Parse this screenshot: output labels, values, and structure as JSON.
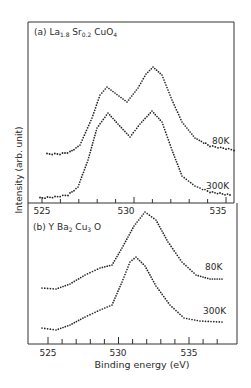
{
  "figure": {
    "y_axis_label": "Intensity (arb. unit)",
    "x_axis_label": "Binding energy (eV)"
  },
  "panel_a": {
    "label_prefix": "(a) La",
    "sub1": "1.8",
    "mid": " Sr",
    "sub2": "0.2",
    "mid2": " CuO",
    "sub3": "4",
    "ticks": [
      "525",
      "530",
      "535"
    ],
    "curve_labels": [
      "80K",
      "300K"
    ]
  },
  "panel_b": {
    "label_prefix": "(b) Y Ba",
    "sub1": "2",
    "mid": " Cu",
    "sub2": "3",
    "mid2": " O",
    "sub3": "7",
    "ticks": [
      "525",
      "530",
      "535"
    ],
    "curve_labels": [
      "80K",
      "300K"
    ]
  },
  "chart_data": [
    {
      "type": "scatter",
      "title": "(a) La1.8Sr0.2CuO4",
      "xlabel": "Binding energy (eV)",
      "ylabel": "Intensity (arb. unit)",
      "xlim": [
        524.5,
        536.5
      ],
      "x_ticks": [
        525,
        530,
        535
      ],
      "grid": false,
      "series": [
        {
          "name": "80K",
          "x": [
            525,
            526,
            527,
            528,
            529.2,
            530.2,
            531.5,
            532.5,
            533.5,
            535,
            536.5
          ],
          "y": [
            0.35,
            0.36,
            0.45,
            0.72,
            0.82,
            0.74,
            0.98,
            0.8,
            0.55,
            0.42,
            0.38
          ]
        },
        {
          "name": "300K",
          "x": [
            525,
            526,
            527,
            528,
            529.2,
            530.2,
            531.5,
            532.5,
            533.5,
            535,
            536.5
          ],
          "y": [
            0.02,
            0.05,
            0.2,
            0.55,
            0.68,
            0.55,
            0.69,
            0.5,
            0.18,
            0.06,
            0.04
          ]
        }
      ]
    },
    {
      "type": "scatter",
      "title": "(b) YBa2Cu3O7",
      "xlabel": "Binding energy (eV)",
      "ylabel": "Intensity (arb. unit)",
      "xlim": [
        524,
        538.5
      ],
      "x_ticks": [
        525,
        530,
        535
      ],
      "grid": false,
      "series": [
        {
          "name": "80K",
          "x": [
            524.5,
            526,
            527.5,
            529.3,
            530.5,
            531.8,
            533,
            534.5,
            536,
            537.2
          ],
          "y": [
            0.42,
            0.4,
            0.5,
            0.62,
            0.85,
            1.0,
            0.8,
            0.55,
            0.45,
            0.46
          ]
        },
        {
          "name": "300K",
          "x": [
            524.5,
            526,
            527.5,
            529.3,
            530.5,
            531.2,
            532.3,
            533.5,
            535,
            537.2
          ],
          "y": [
            0.08,
            0.07,
            0.2,
            0.3,
            0.6,
            0.76,
            0.6,
            0.3,
            0.15,
            0.15
          ]
        }
      ]
    }
  ]
}
